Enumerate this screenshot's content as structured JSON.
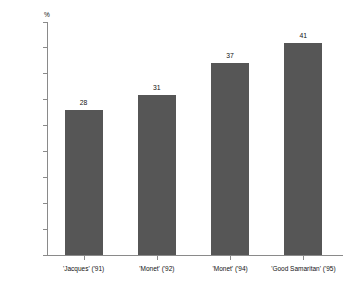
{
  "chart_data": {
    "type": "bar",
    "title": "",
    "subtitle": "",
    "xlabel": "",
    "ylabel": "",
    "unit_label": "%",
    "categories": [
      "'Jacques' ('91)",
      "'Monet' ('92)",
      "'Monet' ('94)",
      "'Good Samaritan' ('95)"
    ],
    "values": [
      28,
      31,
      37,
      41
    ],
    "value_labels": [
      "28",
      "31",
      "37",
      "41"
    ],
    "ylim": [
      0,
      45
    ],
    "ytick_values": [
      0,
      5,
      10,
      15,
      20,
      25,
      30,
      35,
      40,
      45
    ],
    "ytick_labels": [
      "0",
      "5",
      "10",
      "15",
      "20",
      "25",
      "30",
      "35",
      "40",
      "45"
    ],
    "grid": false,
    "legend": false,
    "legend_position": "none",
    "bar_color": "#565656",
    "axis_color": "#8a8a8a",
    "background_color": "#ffffff",
    "text_color": "#111111"
  }
}
